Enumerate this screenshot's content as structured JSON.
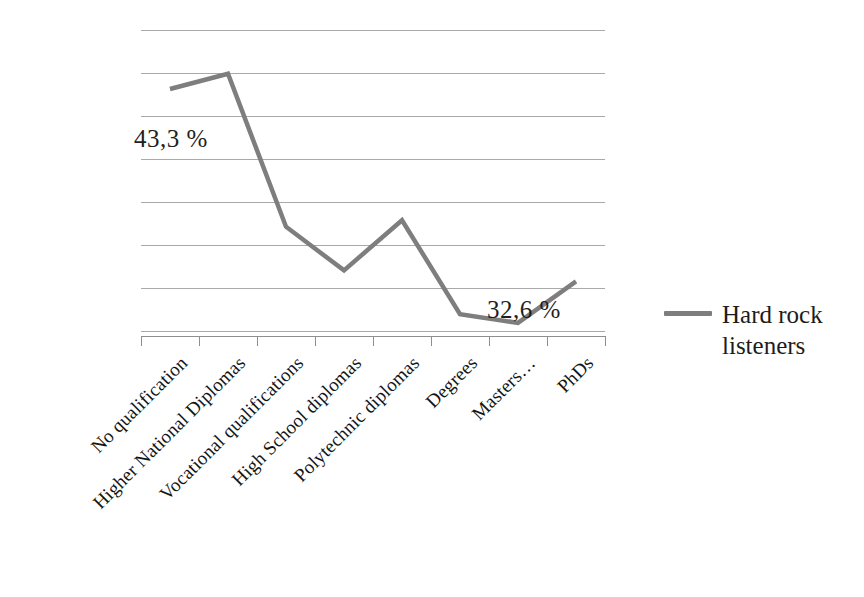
{
  "chart_data": {
    "type": "line",
    "title": "",
    "subtitle": "",
    "xlabel": "",
    "ylabel": "",
    "grid": true,
    "legend_position": "right",
    "categories": [
      "No qualification",
      "Higher National Diplomas",
      "Vocational qualifications",
      "High School diplomas",
      "Polytechnic diplomas",
      "Degrees",
      "Masters…",
      "PhDs"
    ],
    "series": [
      {
        "name": "Hard rock listeners",
        "color": "#7e7e7e",
        "values": [
          43.3,
          44.0,
          37.0,
          35.0,
          37.3,
          33.0,
          32.6,
          34.5
        ]
      }
    ],
    "ylim": [
      32.0,
      46.0
    ],
    "y_gridline_values": [
      46.0,
      45.0,
      44.0,
      43.0,
      42.0,
      41.0,
      40.0,
      39.0
    ],
    "annotations": [
      {
        "text": "43,3 %",
        "category": "No qualification",
        "value": 43.3
      },
      {
        "text": "32,6 %",
        "category": "Masters…",
        "value": 32.6
      }
    ]
  },
  "legend": {
    "entries": [
      {
        "label_line1": "Hard rock",
        "label_line2": "listeners",
        "color": "#7e7e7e"
      }
    ]
  },
  "axis": {
    "gridline_count": 8,
    "tick_count": 9
  },
  "colors": {
    "series_line": "#7e7e7e",
    "gridline": "#9a9a9a",
    "axis": "#8e8e8e",
    "text": "#1a1a1a",
    "background": "#ffffff"
  }
}
